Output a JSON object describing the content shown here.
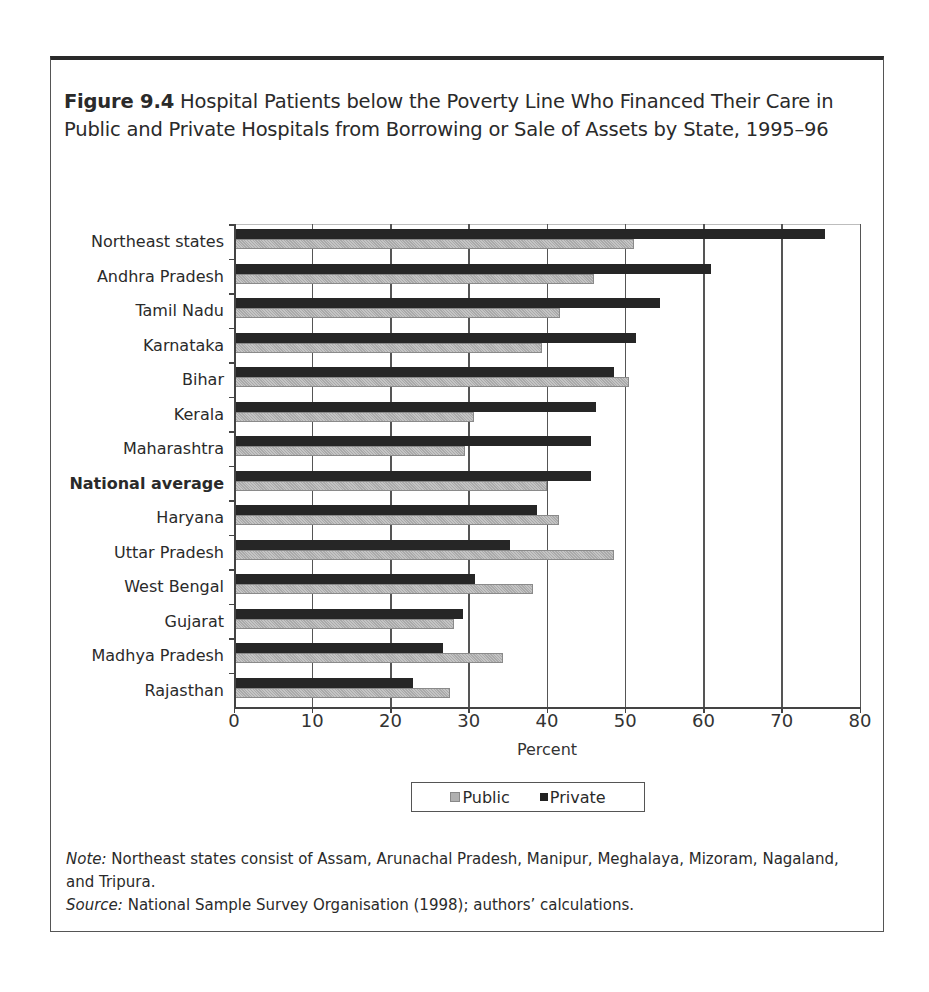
{
  "figure": {
    "label": "Figure 9.4",
    "title": "Hospital Patients below the Poverty Line Who Financed Their Care in Public and Private Hospitals from Borrowing or Sale of Assets by State, 1995–96"
  },
  "legend": {
    "public": "Public",
    "private": "Private"
  },
  "notes": {
    "note_label": "Note:",
    "note_text": " Northeast states consist of Assam, Arunachal Pradesh, Manipur, Meghalaya, Mizoram, Nagaland, and Tripura.",
    "source_label": "Source:",
    "source_text": " National Sample Survey Organisation (1998); authors’ calculations."
  },
  "colors": {
    "public": "#b6b6b6",
    "private": "#262626"
  },
  "chart_data": {
    "type": "bar",
    "orientation": "horizontal",
    "title": "Figure 9.4 Hospital Patients below the Poverty Line Who Financed Their Care in Public and Private Hospitals from Borrowing or Sale of Assets by State, 1995–96",
    "xlabel": "Percent",
    "ylabel": "",
    "xlim": [
      0,
      80
    ],
    "xticks": [
      0,
      10,
      20,
      30,
      40,
      50,
      60,
      70,
      80
    ],
    "grid": true,
    "legend_position": "bottom",
    "categories": [
      "Northeast states",
      "Andhra Pradesh",
      "Tamil Nadu",
      "Karnataka",
      "Bihar",
      "Kerala",
      "Maharashtra",
      "National average",
      "Haryana",
      "Uttar Pradesh",
      "West Bengal",
      "Gujarat",
      "Madhya Pradesh",
      "Rajasthan"
    ],
    "highlighted_category": "National average",
    "series": [
      {
        "name": "Public",
        "values": [
          51.0,
          45.9,
          41.5,
          39.2,
          50.4,
          30.5,
          29.4,
          39.9,
          41.4,
          48.4,
          38.1,
          28.0,
          34.2,
          27.5
        ]
      },
      {
        "name": "Private",
        "values": [
          75.4,
          60.8,
          54.3,
          51.2,
          48.4,
          46.1,
          45.5,
          45.5,
          38.6,
          35.1,
          30.7,
          29.1,
          26.6,
          22.7
        ]
      }
    ]
  }
}
